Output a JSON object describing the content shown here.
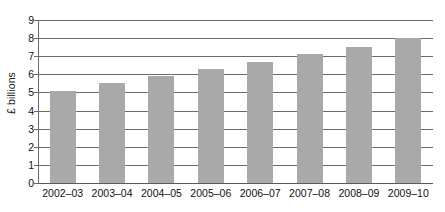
{
  "chart_data": {
    "type": "bar",
    "title": "",
    "subtitle": "",
    "xlabel": "",
    "ylabel": "£ billions",
    "categories": [
      "2002–03",
      "2003–04",
      "2004–05",
      "2005–06",
      "2006–07",
      "2007–08",
      "2008–09",
      "2009–10"
    ],
    "values": [
      5.1,
      5.5,
      5.9,
      6.3,
      6.7,
      7.1,
      7.5,
      8.0
    ],
    "series": [
      {
        "name": "",
        "values": [
          5.1,
          5.5,
          5.9,
          6.3,
          6.7,
          7.1,
          7.5,
          8.0
        ]
      }
    ],
    "ylim": [
      0,
      9
    ],
    "ytick_labels": [
      "0",
      "1",
      "2",
      "3",
      "4",
      "5",
      "6",
      "7",
      "8",
      "9"
    ],
    "ytick_values": [
      0,
      1,
      2,
      3,
      4,
      5,
      6,
      7,
      8,
      9
    ],
    "grid": true,
    "grid_axis": "y",
    "legend": false,
    "legend_position": "none",
    "bar_color": "#a9a9a9",
    "gridline_color": "#6b6b6b",
    "text_color": "#111111",
    "background_color": "#ffffff"
  },
  "axes": {
    "y_title": "£ billions"
  }
}
